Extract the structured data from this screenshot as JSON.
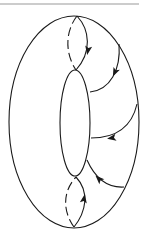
{
  "diagram": {
    "title": "",
    "type": "torus-flow-diagram",
    "colors": {
      "stroke": "#1a1a1a",
      "rule": "#9a9a9a",
      "background": "#ffffff"
    },
    "top_rule": {
      "x1": 0,
      "x2": 139,
      "y": 4
    },
    "outer_ellipse": {
      "cx": 74,
      "cy": 122,
      "rx": 65,
      "ry": 106
    },
    "inner_ellipse": {
      "cx": 75,
      "cy": 123,
      "rx": 15,
      "ry": 53
    },
    "curves": [
      {
        "id": "top-meridian-front",
        "style": "solid",
        "d": "M77,16 C90,30 92,52 76,70",
        "arrow": {
          "x": 88,
          "y": 50,
          "angle": 100
        }
      },
      {
        "id": "top-meridian-back",
        "style": "dashed",
        "d": "M77,16 C66,30 64,52 76,70"
      },
      {
        "id": "flow-line-1",
        "style": "solid",
        "d": "M119,44 C121,70 110,90 90,92",
        "arrow": {
          "x": 115,
          "y": 72,
          "angle": 115
        }
      },
      {
        "id": "flow-line-2",
        "style": "solid",
        "d": "M137,104 C132,126 118,138 91,138",
        "arrow": {
          "x": 112,
          "y": 138,
          "angle": 170
        }
      },
      {
        "id": "flow-line-3",
        "style": "solid",
        "d": "M124,187 C108,188 96,180 87,160",
        "arrow": {
          "x": 99,
          "y": 179,
          "angle": 225
        }
      },
      {
        "id": "bottom-meridian-front",
        "style": "solid",
        "d": "M74,227 C86,212 90,192 76,177",
        "arrow": {
          "x": 84,
          "y": 199,
          "angle": -80
        }
      },
      {
        "id": "bottom-meridian-back",
        "style": "dashed",
        "d": "M74,227 C63,212 62,192 76,177"
      }
    ]
  }
}
